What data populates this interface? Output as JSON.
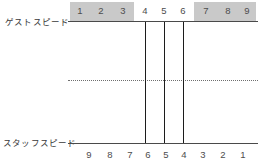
{
  "chart_data": {
    "type": "line",
    "title": "",
    "subtitle": "",
    "axes": [
      {
        "id": "guest",
        "label": "ゲストスピード",
        "position": "top",
        "tick_labels": [
          "1",
          "2",
          "3",
          "4",
          "5",
          "6",
          "7",
          "8",
          "9"
        ],
        "direction": "left-to-right ascending",
        "highlight_bands": [
          {
            "from_tick": "1",
            "to_tick": "3",
            "color": "#c9c9c9"
          },
          {
            "from_tick": "7",
            "to_tick": "9",
            "color": "#c9c9c9"
          }
        ]
      },
      {
        "id": "staff",
        "label": "スタッフスピード",
        "position": "bottom",
        "tick_labels": [
          "9",
          "8",
          "7",
          "6",
          "5",
          "4",
          "3",
          "2",
          "1"
        ],
        "direction": "left-to-right descending",
        "highlight_bands": []
      }
    ],
    "connectors": [
      {
        "guest_value": "4",
        "staff_value": "6"
      },
      {
        "guest_value": "5",
        "staff_value": "5"
      },
      {
        "guest_value": "6",
        "staff_value": "4"
      }
    ],
    "midline": {
      "style": "dotted",
      "color": "#6f6f6f"
    },
    "grid": false,
    "legend": null,
    "colors": {
      "band": "#c9c9c9",
      "axis": "#4a4a4a",
      "connector": "#1c1c1c",
      "midline": "#6f6f6f",
      "text": "#4d4d4d",
      "background": "#ffffff"
    }
  },
  "guest_axis": {
    "label": "ゲストスピード",
    "ticks": [
      {
        "value": "1",
        "x": 80,
        "highlighted": true
      },
      {
        "value": "2",
        "x": 101,
        "highlighted": true
      },
      {
        "value": "3",
        "x": 123,
        "highlighted": true
      },
      {
        "value": "4",
        "x": 145,
        "highlighted": false
      },
      {
        "value": "5",
        "x": 164,
        "highlighted": false
      },
      {
        "value": "6",
        "x": 183,
        "highlighted": false
      },
      {
        "value": "7",
        "x": 206,
        "highlighted": true
      },
      {
        "value": "8",
        "x": 228,
        "highlighted": true
      },
      {
        "value": "9",
        "x": 247,
        "highlighted": true
      }
    ],
    "bands": [
      {
        "name": "low-band",
        "left": 70,
        "width": 64
      },
      {
        "name": "high-band",
        "left": 194,
        "width": 62
      }
    ]
  },
  "staff_axis": {
    "label": "スタッフスピード",
    "ticks": [
      {
        "value": "9",
        "x": 89
      },
      {
        "value": "8",
        "x": 110
      },
      {
        "value": "7",
        "x": 130
      },
      {
        "value": "6",
        "x": 148
      },
      {
        "value": "5",
        "x": 166
      },
      {
        "value": "4",
        "x": 184
      },
      {
        "value": "3",
        "x": 203
      },
      {
        "value": "2",
        "x": 223
      },
      {
        "value": "1",
        "x": 243
      }
    ]
  },
  "connectors": [
    {
      "name": "connector-guest4-staff6",
      "x": 145
    },
    {
      "name": "connector-guest5-staff5",
      "x": 164
    },
    {
      "name": "connector-guest6-staff4",
      "x": 183
    }
  ]
}
